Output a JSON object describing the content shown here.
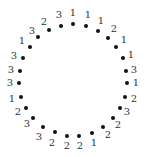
{
  "diagram": {
    "type": "circular-sequence",
    "center": [
      74,
      81
    ],
    "dot_color": "#111111",
    "label_color": "#333333",
    "order": "clockwise from top",
    "points": [
      {
        "label": "1",
        "dot": [
          73,
          24
        ],
        "text": [
          73,
          13
        ]
      },
      {
        "label": "1",
        "dot": [
          86,
          26
        ],
        "text": [
          88,
          15
        ]
      },
      {
        "label": "1",
        "dot": [
          98,
          31
        ],
        "text": [
          101,
          21
        ]
      },
      {
        "label": "2",
        "dot": [
          108,
          38
        ],
        "text": [
          114,
          29
        ]
      },
      {
        "label": "1",
        "dot": [
          116,
          47
        ],
        "text": [
          124,
          40
        ]
      },
      {
        "label": "1",
        "dot": [
          123,
          58
        ],
        "text": [
          131,
          55
        ]
      },
      {
        "label": "3",
        "dot": [
          126,
          71
        ],
        "text": [
          134,
          70
        ]
      },
      {
        "label": "1",
        "dot": [
          127,
          83
        ],
        "text": [
          136,
          83
        ]
      },
      {
        "label": "2",
        "dot": [
          125,
          97
        ],
        "text": [
          134,
          99
        ]
      },
      {
        "label": "3",
        "dot": [
          120,
          108
        ],
        "text": [
          127,
          112
        ]
      },
      {
        "label": "2",
        "dot": [
          113,
          118
        ],
        "text": [
          118,
          125
        ]
      },
      {
        "label": "2",
        "dot": [
          103,
          127
        ],
        "text": [
          108,
          135
        ]
      },
      {
        "label": "1",
        "dot": [
          92,
          133
        ],
        "text": [
          94,
          143
        ]
      },
      {
        "label": "2",
        "dot": [
          79,
          136
        ],
        "text": [
          80,
          146
        ]
      },
      {
        "label": "2",
        "dot": [
          67,
          136
        ],
        "text": [
          67,
          146
        ]
      },
      {
        "label": "2",
        "dot": [
          55,
          132
        ],
        "text": [
          52,
          143
        ]
      },
      {
        "label": "3",
        "dot": [
          43,
          127
        ],
        "text": [
          39,
          137
        ]
      },
      {
        "label": "3",
        "dot": [
          33,
          118
        ],
        "text": [
          27,
          124
        ]
      },
      {
        "label": "2",
        "dot": [
          26,
          108
        ],
        "text": [
          18,
          112
        ]
      },
      {
        "label": "1",
        "dot": [
          21,
          97
        ],
        "text": [
          12,
          99
        ]
      },
      {
        "label": "3",
        "dot": [
          19,
          83
        ],
        "text": [
          10,
          83
        ]
      },
      {
        "label": "3",
        "dot": [
          20,
          71
        ],
        "text": [
          11,
          70
        ]
      },
      {
        "label": "3",
        "dot": [
          23,
          58
        ],
        "text": [
          14,
          56
        ]
      },
      {
        "label": "1",
        "dot": [
          30,
          47
        ],
        "text": [
          22,
          41
        ]
      },
      {
        "label": "3",
        "dot": [
          38,
          37
        ],
        "text": [
          32,
          31
        ]
      },
      {
        "label": "2",
        "dot": [
          49,
          30
        ],
        "text": [
          44,
          22
        ]
      },
      {
        "label": "3",
        "dot": [
          61,
          26
        ],
        "text": [
          59,
          15
        ]
      }
    ]
  }
}
